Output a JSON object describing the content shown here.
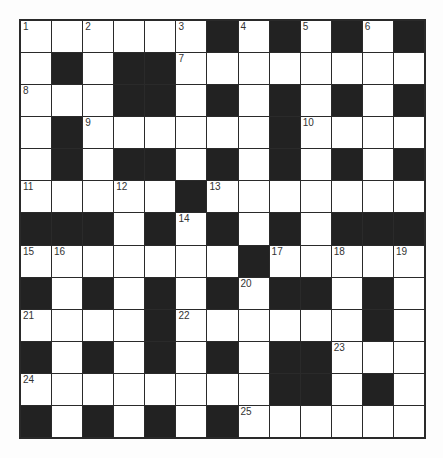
{
  "puzzle": {
    "rows": 13,
    "cols": 13,
    "colors": {
      "black": "#222222",
      "white": "#ffffff",
      "border": "#2a2a2a"
    },
    "layout": [
      "WWWWWWBWBWBWB",
      "WBWBBWWWWWWWW",
      "WWWBBWBWBWBWB",
      "WBWWWWWWBWWWW",
      "WBWBBWBWBWBWB",
      "WWWWWBWWWWWWW",
      "BBBWBWBWBWBBB",
      "WWWWWWWBWWWWW",
      "BWBWBWBWBBWBW",
      "WWWWBWWWWWWBW",
      "BWBWBWBWBBWWW",
      "WWWWWWWWBBWBW",
      "BWBWBWBWWWWWW"
    ],
    "numbers": [
      {
        "r": 0,
        "c": 0,
        "n": "1"
      },
      {
        "r": 0,
        "c": 2,
        "n": "2"
      },
      {
        "r": 0,
        "c": 5,
        "n": "3"
      },
      {
        "r": 0,
        "c": 7,
        "n": "4"
      },
      {
        "r": 0,
        "c": 9,
        "n": "5"
      },
      {
        "r": 0,
        "c": 11,
        "n": "6"
      },
      {
        "r": 1,
        "c": 5,
        "n": "7"
      },
      {
        "r": 2,
        "c": 0,
        "n": "8"
      },
      {
        "r": 3,
        "c": 2,
        "n": "9"
      },
      {
        "r": 3,
        "c": 9,
        "n": "10"
      },
      {
        "r": 5,
        "c": 0,
        "n": "11"
      },
      {
        "r": 5,
        "c": 3,
        "n": "12"
      },
      {
        "r": 5,
        "c": 6,
        "n": "13"
      },
      {
        "r": 6,
        "c": 5,
        "n": "14"
      },
      {
        "r": 7,
        "c": 0,
        "n": "15"
      },
      {
        "r": 7,
        "c": 1,
        "n": "16"
      },
      {
        "r": 7,
        "c": 8,
        "n": "17"
      },
      {
        "r": 7,
        "c": 10,
        "n": "18"
      },
      {
        "r": 7,
        "c": 12,
        "n": "19"
      },
      {
        "r": 8,
        "c": 7,
        "n": "20"
      },
      {
        "r": 9,
        "c": 0,
        "n": "21"
      },
      {
        "r": 9,
        "c": 5,
        "n": "22"
      },
      {
        "r": 10,
        "c": 10,
        "n": "23"
      },
      {
        "r": 11,
        "c": 0,
        "n": "24"
      },
      {
        "r": 12,
        "c": 7,
        "n": "25"
      }
    ]
  }
}
